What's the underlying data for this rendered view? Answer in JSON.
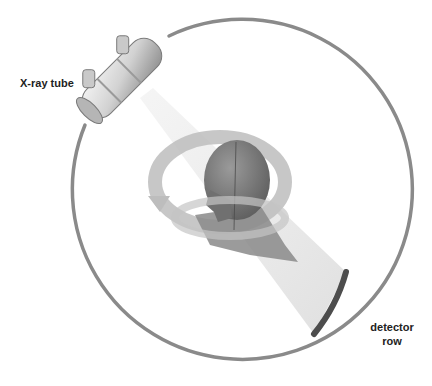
{
  "diagram": {
    "type": "CT scanner schematic",
    "labels": {
      "xray_tube": "X-ray tube",
      "detector_line1": "detector",
      "detector_line2": "row"
    },
    "colors": {
      "background": "#ffffff",
      "gantry_ring": "#8a8a8a",
      "detector": "#4d4d4d",
      "beam": "#e2e2e2",
      "rotation_arrow": "#b9b9b9",
      "head": "#7a7a7a",
      "tube_body": "#d6d6d6",
      "text": "#222222"
    },
    "components": [
      "gantry-ring",
      "x-ray-tube",
      "x-ray-beam",
      "patient-head",
      "rotation-arrow",
      "detector-row"
    ]
  }
}
